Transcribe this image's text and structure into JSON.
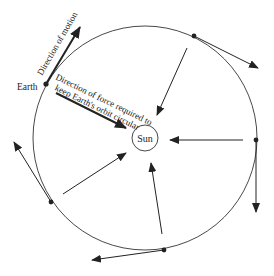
{
  "diagram": {
    "labels": {
      "earth": "Earth",
      "sun": "Sun",
      "motion": "Direction of motion",
      "force_line1": "Direction of force required to",
      "force_line2": "keep Earth's orbit circular"
    },
    "orbit": {
      "cx": 145,
      "cy": 138,
      "r": 112
    },
    "sun": {
      "cx": 145,
      "cy": 138,
      "r": 13
    },
    "positions": [
      {
        "name": "earth",
        "dot": [
          46,
          84
        ],
        "tangent_to": [
          80,
          27
        ],
        "force_from": [
          56,
          93
        ],
        "force_to": [
          126,
          128
        ],
        "bold": true
      },
      {
        "name": "top-right",
        "dot": [
          194,
          36
        ],
        "tangent_to": [
          258,
          68
        ],
        "force_from": [
          187,
          48
        ],
        "force_to": [
          157,
          115
        ]
      },
      {
        "name": "right",
        "dot": [
          256,
          140
        ],
        "tangent_to": [
          256,
          212
        ],
        "force_from": [
          243,
          140
        ],
        "force_to": [
          170,
          140
        ]
      },
      {
        "name": "bottom",
        "dot": [
          164,
          250
        ],
        "tangent_to": [
          92,
          260
        ],
        "force_from": [
          162,
          234
        ],
        "force_to": [
          151,
          163
        ]
      },
      {
        "name": "bottom-left",
        "dot": [
          51,
          202
        ],
        "tangent_to": [
          14,
          142
        ],
        "force_from": [
          63,
          194
        ],
        "force_to": [
          126,
          153
        ]
      }
    ],
    "colors": {
      "stroke": "#222222",
      "background": "#ffffff"
    }
  }
}
